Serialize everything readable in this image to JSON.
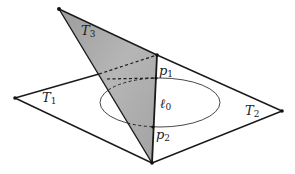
{
  "colors": {
    "stroke": "#1a1a1a",
    "shade": "#a9a9a9",
    "background": "#ffffff"
  },
  "labels": {
    "T1": {
      "base": "T",
      "sub": "1"
    },
    "T2": {
      "base": "T",
      "sub": "2"
    },
    "T3": {
      "base": "T",
      "sub": "3"
    },
    "p1": {
      "base": "p",
      "sub": "1"
    },
    "p2": {
      "base": "p",
      "sub": "2"
    },
    "l0": {
      "base": "ℓ",
      "sub": "0"
    }
  },
  "vertices": {
    "apex_T3": [
      59,
      9
    ],
    "top": [
      157,
      55
    ],
    "right": [
      282,
      111
    ],
    "bottom": [
      152,
      163
    ],
    "left": [
      15,
      98
    ],
    "p1": [
      156,
      78
    ],
    "p2": [
      153,
      127
    ]
  }
}
